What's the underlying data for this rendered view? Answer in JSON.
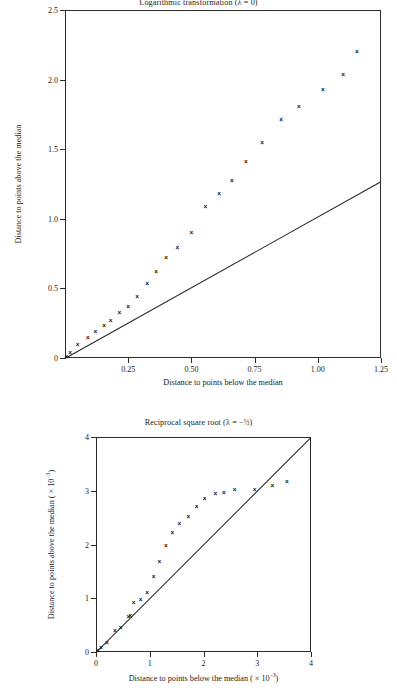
{
  "page": {
    "background": "#ffffff",
    "ink": "#1a1a1a"
  },
  "figures": [
    {
      "id": "logarithmic-transformation",
      "title": "Logarithmic transformation (λ = 0)",
      "title_clipped": true,
      "xlabel": "Distance to points below the median",
      "ylabel": "Distance to points above the median",
      "xticks": [
        "0.25",
        "0.50",
        "0.75",
        "1.00",
        "1.25"
      ],
      "yticks": [
        "0",
        "0.5",
        "1.0",
        "1.5",
        "2.0",
        "2.5"
      ]
    },
    {
      "id": "reciprocal-square-root",
      "title": "Reciprocal square root (λ = −½)",
      "title_clipped": false,
      "xlabel": "Distance to points below the median ( × 10⁻³)",
      "ylabel": "Distance to points above the median ( × 10⁻³)",
      "xticks": [
        "0",
        "1",
        "2",
        "3",
        "4"
      ],
      "yticks": [
        "0",
        "1",
        "2",
        "3",
        "4"
      ]
    }
  ],
  "chart_data": [
    {
      "type": "scatter",
      "title": "Logarithmic transformation (λ = 0)",
      "xlabel": "Distance to points below the median",
      "ylabel": "Distance to points above the median",
      "xlim": [
        0,
        1.25
      ],
      "ylim": [
        0,
        2.5
      ],
      "xticks": [
        0.25,
        0.5,
        0.75,
        1.0,
        1.25
      ],
      "xticklabels": [
        "0.25",
        "0.50",
        "0.75",
        "1.00",
        "1.25"
      ],
      "yticks": [
        0,
        0.5,
        1.0,
        1.5,
        2.0,
        2.5
      ],
      "yticklabels": [
        "0",
        "0.5",
        "1.0",
        "1.5",
        "2.0",
        "2.5"
      ],
      "grid": false,
      "legend": false,
      "marker": "x",
      "x": [
        0.005,
        0.02,
        0.05,
        0.09,
        0.12,
        0.155,
        0.18,
        0.215,
        0.25,
        0.285,
        0.325,
        0.36,
        0.4,
        0.445,
        0.5,
        0.555,
        0.61,
        0.66,
        0.715,
        0.78,
        0.855,
        0.925,
        1.02,
        1.1,
        1.155
      ],
      "y": [
        0.01,
        0.04,
        0.1,
        0.145,
        0.19,
        0.235,
        0.27,
        0.33,
        0.37,
        0.44,
        0.535,
        0.625,
        0.72,
        0.795,
        0.9,
        1.085,
        1.18,
        1.275,
        1.41,
        1.545,
        1.71,
        1.805,
        1.93,
        2.035,
        2.2
      ],
      "reference_line": {
        "label": "reference line",
        "from": [
          0.0,
          0.0
        ],
        "to": [
          1.25,
          1.27
        ]
      }
    },
    {
      "type": "scatter",
      "title": "Reciprocal square root (λ = −½)",
      "xlabel": "Distance to points below the median ( × 10⁻³)",
      "ylabel": "Distance to points above the median ( × 10⁻³)",
      "xlim": [
        0,
        4
      ],
      "ylim": [
        0,
        4
      ],
      "xticks": [
        0,
        1,
        2,
        3,
        4
      ],
      "xticklabels": [
        "0",
        "1",
        "2",
        "3",
        "4"
      ],
      "yticks": [
        0,
        1,
        2,
        3,
        4
      ],
      "yticklabels": [
        "0",
        "1",
        "2",
        "3",
        "4"
      ],
      "grid": false,
      "legend": false,
      "marker": "x",
      "unit_scale": "× 10⁻³",
      "x": [
        0.04,
        0.09,
        0.2,
        0.35,
        0.46,
        0.6,
        0.64,
        0.7,
        0.83,
        0.95,
        1.07,
        1.18,
        1.3,
        1.42,
        1.55,
        1.72,
        1.87,
        2.02,
        2.22,
        2.38,
        2.58,
        2.95,
        3.28,
        3.55
      ],
      "y": [
        0.03,
        0.09,
        0.17,
        0.4,
        0.46,
        0.66,
        0.68,
        0.92,
        0.97,
        1.11,
        1.41,
        1.69,
        1.99,
        2.23,
        2.4,
        2.53,
        2.71,
        2.86,
        2.95,
        2.96,
        3.02,
        3.03,
        3.1,
        3.17
      ],
      "reference_line": {
        "label": "reference line",
        "from": [
          0,
          0
        ],
        "to": [
          4,
          4
        ]
      }
    }
  ]
}
